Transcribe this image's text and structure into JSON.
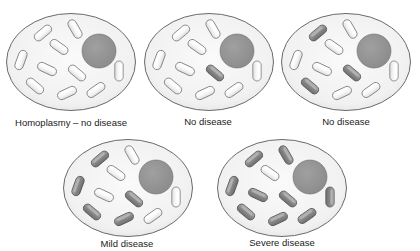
{
  "figure": {
    "colors": {
      "background": "#ffffff",
      "cell_fill": "#f1f1f1",
      "cell_stroke": "#6a6a6a",
      "nucleus_fill": "#8c8c8c",
      "nucleus_stroke": "#6f6f6f",
      "mito_normal_fill": "#f6f6f6",
      "mito_normal_stroke": "#7a7a7a",
      "mito_mutant_fill": "#8a8a8a",
      "mito_mutant_stroke": "#555555"
    },
    "cells": [
      {
        "id": "cell-homoplasmy",
        "x": 5,
        "y": 12,
        "label": "Homoplasmy – no disease",
        "label_x": 71,
        "label_y": 117,
        "mutant_mitochondria": []
      },
      {
        "id": "cell-no-disease-1",
        "x": 143,
        "y": 12,
        "label": "No disease",
        "label_x": 208,
        "label_y": 116,
        "mutant_mitochondria": [
          6
        ]
      },
      {
        "id": "cell-no-disease-2",
        "x": 280,
        "y": 12,
        "label": "No disease",
        "label_x": 346,
        "label_y": 116,
        "mutant_mitochondria": [
          1,
          6,
          7
        ]
      },
      {
        "id": "cell-mild-disease",
        "x": 62,
        "y": 138,
        "label": "Mild disease",
        "label_x": 127,
        "label_y": 238,
        "mutant_mitochondria": [
          1,
          4,
          6,
          7,
          8
        ]
      },
      {
        "id": "cell-severe-disease",
        "x": 216,
        "y": 138,
        "label": "Severe disease",
        "label_x": 282,
        "label_y": 237,
        "mutant_mitochondria": [
          1,
          2,
          4,
          5,
          6,
          7,
          8,
          9,
          10
        ]
      }
    ],
    "layout": {
      "mitochondria": [
        {
          "n": 1,
          "cx": 38,
          "cy": 21,
          "angle": -40
        },
        {
          "n": 2,
          "cx": 70,
          "cy": 17,
          "angle": 60
        },
        {
          "n": 3,
          "cx": 54,
          "cy": 35,
          "angle": 35
        },
        {
          "n": 4,
          "cx": 16,
          "cy": 48,
          "angle": -70
        },
        {
          "n": 5,
          "cx": 42,
          "cy": 57,
          "angle": 25
        },
        {
          "n": 6,
          "cx": 72,
          "cy": 61,
          "angle": 40
        },
        {
          "n": 7,
          "cx": 30,
          "cy": 74,
          "angle": 40
        },
        {
          "n": 8,
          "cx": 62,
          "cy": 81,
          "angle": -25
        },
        {
          "n": 9,
          "cx": 91,
          "cy": 78,
          "angle": -35
        },
        {
          "n": 10,
          "cx": 114,
          "cy": 59,
          "angle": 90
        }
      ],
      "nucleus": {
        "cx": 94,
        "cy": 39,
        "r": 17
      }
    }
  }
}
